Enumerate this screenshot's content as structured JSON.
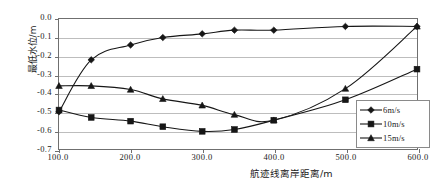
{
  "chart_data": {
    "type": "line",
    "title": "",
    "xlabel": "航迹线离岸距离/m",
    "ylabel": "最低水位/m",
    "xlim": [
      100,
      600
    ],
    "ylim": [
      -0.7,
      0.0
    ],
    "grid": true,
    "legend_position": "right-bottom",
    "x": [
      100,
      145,
      200,
      245,
      300,
      345,
      400,
      500,
      600
    ],
    "x_tick_labels": [
      "100.0",
      "200.0",
      "300.0",
      "400.0",
      "500.0",
      "600.0"
    ],
    "x_tick_values": [
      100,
      200,
      300,
      400,
      500,
      600
    ],
    "y_tick_labels": [
      "0.0",
      "-0.1",
      "-0.2",
      "-0.3",
      "-0.4",
      "-0.5",
      "-0.6",
      "-0.7"
    ],
    "y_tick_values": [
      0.0,
      -0.1,
      -0.2,
      -0.3,
      -0.4,
      -0.5,
      -0.6,
      -0.7
    ],
    "series": [
      {
        "name": "6m/s",
        "marker": "diamond",
        "color": "#161616",
        "values": [
          -0.5,
          -0.22,
          -0.14,
          -0.1,
          -0.08,
          -0.06,
          -0.06,
          -0.04,
          -0.04
        ]
      },
      {
        "name": "10m/s",
        "marker": "square",
        "color": "#161616",
        "values": [
          -0.49,
          -0.53,
          -0.55,
          -0.58,
          -0.605,
          -0.595,
          -0.545,
          -0.435,
          -0.27
        ]
      },
      {
        "name": "15m/s",
        "marker": "triangle",
        "color": "#161616",
        "values": [
          -0.36,
          -0.36,
          -0.38,
          -0.43,
          -0.465,
          -0.515,
          -0.545,
          -0.375,
          -0.04
        ]
      }
    ]
  },
  "legend": {
    "items": [
      {
        "label": "6m/s",
        "marker": "diamond"
      },
      {
        "label": "10m/s",
        "marker": "square"
      },
      {
        "label": "15m/s",
        "marker": "triangle"
      }
    ]
  },
  "axis": {
    "y_title": "最低水位/m",
    "x_title": "航迹线离岸距离/m"
  }
}
